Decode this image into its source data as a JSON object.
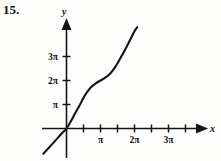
{
  "problem": {
    "number": "15."
  },
  "chart_data": {
    "type": "line",
    "title": "",
    "xlabel": "x",
    "ylabel": "y",
    "xlim": [
      -0.75,
      3.75
    ],
    "ylim": [
      -1.2,
      4.4
    ],
    "grid": false,
    "legend": null,
    "x_unit": "pi",
    "y_unit": "pi",
    "x_tick_values": [
      0.5,
      1,
      1.5,
      2,
      2.5,
      3,
      3.5
    ],
    "x_tick_labels": [
      "",
      "π",
      "",
      "2π",
      "",
      "3π",
      ""
    ],
    "x_labeled_ticks": [
      {
        "value": 1,
        "label": "π"
      },
      {
        "value": 2,
        "label": "2π"
      },
      {
        "value": 3,
        "label": "3π"
      }
    ],
    "y_tick_values": [
      1,
      2,
      3
    ],
    "y_tick_labels": [
      "π",
      "2π",
      "3π"
    ],
    "axes": {
      "x_axis_label": "x",
      "y_axis_label": "y",
      "x_arrow": true,
      "y_arrow": true
    },
    "x": [
      -0.68,
      -0.55,
      -0.4,
      -0.25,
      -0.12,
      0.0,
      0.12,
      0.25,
      0.38,
      0.5,
      0.62,
      0.75,
      0.88,
      1.0,
      1.12,
      1.25,
      1.38,
      1.5,
      1.62,
      1.75,
      1.88,
      2.0,
      2.08
    ],
    "values": [
      -1.05,
      -0.85,
      -0.62,
      -0.38,
      -0.18,
      0.0,
      0.28,
      0.62,
      0.95,
      1.28,
      1.55,
      1.76,
      1.9,
      2.0,
      2.1,
      2.24,
      2.45,
      2.72,
      3.02,
      3.35,
      3.72,
      4.05,
      4.22
    ],
    "colors": {
      "curve": "#121212",
      "axis": "#141414",
      "background": "#fdfdfb",
      "text": "#111111"
    }
  }
}
